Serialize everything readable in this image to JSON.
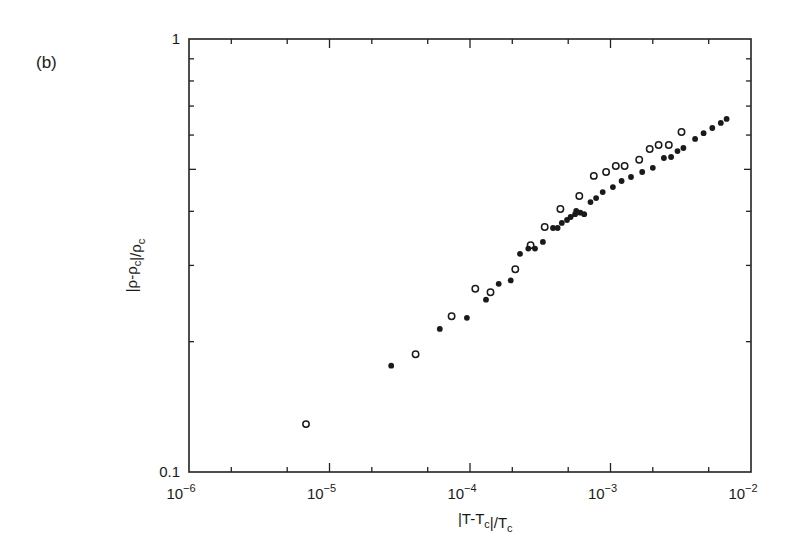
{
  "panel_label": "(b)",
  "chart_data": {
    "type": "scatter",
    "title": "",
    "panel": "(b)",
    "xlabel": "|T-T_c|/T_c",
    "ylabel": "|ρ-ρ_c|/ρ_c",
    "xscale": "log",
    "yscale": "log",
    "xlim": [
      1e-06,
      0.01
    ],
    "ylim": [
      0.1,
      1
    ],
    "x_tick_labels": [
      "10^-6",
      "10^-5",
      "10^-4",
      "10^-3",
      "10^-2"
    ],
    "y_tick_labels": [
      "0.1",
      "1"
    ],
    "grid": false,
    "legend": null,
    "series": [
      {
        "name": "open circles",
        "marker": "open-circle",
        "points": [
          [
            6.8e-06,
            0.129
          ],
          [
            4.1e-05,
            0.187
          ],
          [
            7.4e-05,
            0.229
          ],
          [
            0.000109,
            0.265
          ],
          [
            0.00014,
            0.26
          ],
          [
            0.00021,
            0.294
          ],
          [
            0.00027,
            0.334
          ],
          [
            0.00034,
            0.368
          ],
          [
            0.00044,
            0.405
          ],
          [
            0.0006,
            0.434
          ],
          [
            0.00076,
            0.483
          ],
          [
            0.00093,
            0.493
          ],
          [
            0.00109,
            0.509
          ],
          [
            0.00126,
            0.509
          ],
          [
            0.0016,
            0.526
          ],
          [
            0.0019,
            0.557
          ],
          [
            0.0022,
            0.569
          ],
          [
            0.0026,
            0.569
          ],
          [
            0.0032,
            0.61
          ]
        ]
      },
      {
        "name": "filled circles",
        "marker": "filled-circle",
        "points": [
          [
            2.75e-05,
            0.176
          ],
          [
            6.1e-05,
            0.214
          ],
          [
            9.5e-05,
            0.227
          ],
          [
            0.00013,
            0.25
          ],
          [
            0.00016,
            0.272
          ],
          [
            0.000195,
            0.277
          ],
          [
            0.000227,
            0.319
          ],
          [
            0.00026,
            0.328
          ],
          [
            0.00029,
            0.328
          ],
          [
            0.00033,
            0.34
          ],
          [
            0.00039,
            0.366
          ],
          [
            0.00042,
            0.366
          ],
          [
            0.00045,
            0.376
          ],
          [
            0.00049,
            0.382
          ],
          [
            0.00052,
            0.388
          ],
          [
            0.00056,
            0.394
          ],
          [
            0.00057,
            0.401
          ],
          [
            0.00061,
            0.397
          ],
          [
            0.00065,
            0.394
          ],
          [
            0.00072,
            0.42
          ],
          [
            0.00079,
            0.429
          ],
          [
            0.00088,
            0.443
          ],
          [
            0.00104,
            0.455
          ],
          [
            0.0012,
            0.47
          ],
          [
            0.0014,
            0.48
          ],
          [
            0.00168,
            0.493
          ],
          [
            0.002,
            0.504
          ],
          [
            0.0024,
            0.531
          ],
          [
            0.0027,
            0.534
          ],
          [
            0.003,
            0.551
          ],
          [
            0.0033,
            0.56
          ],
          [
            0.004,
            0.588
          ],
          [
            0.0046,
            0.606
          ],
          [
            0.0053,
            0.623
          ],
          [
            0.0061,
            0.64
          ],
          [
            0.0067,
            0.654
          ]
        ]
      }
    ]
  }
}
